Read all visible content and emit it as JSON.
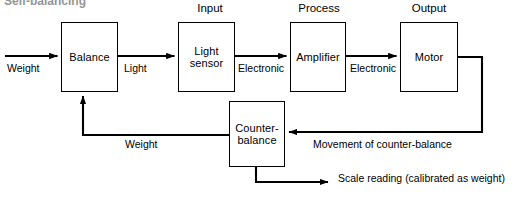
{
  "diagram": {
    "title_clipped": "Self-balancing",
    "section_titles": [
      {
        "label": "Input",
        "x": 181,
        "y": 2,
        "width": 58
      },
      {
        "label": "Process",
        "x": 288,
        "y": 2,
        "width": 62
      },
      {
        "label": "Output",
        "x": 398,
        "y": 2,
        "width": 62
      }
    ],
    "nodes": [
      {
        "id": "balance",
        "label": "Balance",
        "x": 61,
        "y": 22,
        "w": 57,
        "h": 70
      },
      {
        "id": "light-sensor",
        "label": "Light\nsensor",
        "x": 178,
        "y": 22,
        "w": 57,
        "h": 70
      },
      {
        "id": "amplifier",
        "label": "Amplifier",
        "x": 290,
        "y": 22,
        "w": 56,
        "h": 70
      },
      {
        "id": "motor",
        "label": "Motor",
        "x": 400,
        "y": 22,
        "w": 58,
        "h": 70
      },
      {
        "id": "counter-balance",
        "label": "Counter-\nbalance",
        "x": 229,
        "y": 101,
        "w": 56,
        "h": 66
      }
    ],
    "edge_labels": [
      {
        "id": "weight-input",
        "label": "Weight",
        "x": 7,
        "y": 62
      },
      {
        "id": "light",
        "label": "Light",
        "x": 124,
        "y": 62
      },
      {
        "id": "electronic-1",
        "label": "Electronic",
        "x": 238,
        "y": 62
      },
      {
        "id": "electronic-2",
        "label": "Electronic",
        "x": 350,
        "y": 62
      },
      {
        "id": "weight-feedback",
        "label": "Weight",
        "x": 125,
        "y": 138
      },
      {
        "id": "movement-of-counter-balance",
        "label": "Movement of counter-balance",
        "x": 313,
        "y": 138
      },
      {
        "id": "scale-reading",
        "label": "Scale reading (calibrated as weight)",
        "x": 338,
        "y": 172
      }
    ]
  }
}
